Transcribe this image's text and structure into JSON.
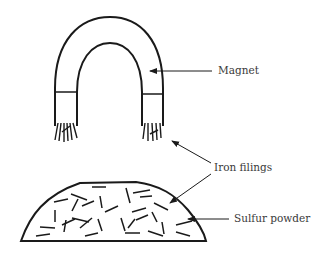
{
  "diagram": {
    "type": "magnet-separating-iron-from-sulfur",
    "labels": {
      "magnet": "Magnet",
      "iron_filings": "Iron filings",
      "sulfur_powder": "Sulfur powder"
    },
    "colors": {
      "stroke": "#1a1a1a",
      "text": "#3a3a3a",
      "background": "#ffffff"
    }
  }
}
